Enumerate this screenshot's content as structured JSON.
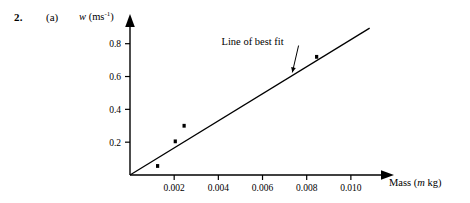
{
  "figure": {
    "question_number": "2.",
    "question_part": "(a)"
  },
  "chart_data": {
    "type": "scatter",
    "title": "",
    "subtitle": "",
    "xlabel": "Mass (m kg)",
    "xlabel_parts": {
      "prefix": "Mass (",
      "variable": "m",
      "suffix": " kg)"
    },
    "ylabel": "w (ms-1)",
    "ylabel_parts": {
      "variable": "w",
      "prefix": " (ms",
      "exponent": "-1",
      "suffix": ")"
    },
    "xlim": [
      0,
      0.0115
    ],
    "ylim": [
      0,
      0.92
    ],
    "xticks": [
      0.002,
      0.004,
      0.006,
      0.008,
      0.01
    ],
    "xticklabels": [
      "0.002",
      "0.004",
      "0.006",
      "0.008",
      "0.010"
    ],
    "yticks": [
      0.2,
      0.4,
      0.6,
      0.8
    ],
    "yticklabels": [
      "0.2",
      "0.4",
      "0.6",
      "0.8"
    ],
    "grid": false,
    "legend_position": "none",
    "axis_arrows": true,
    "points": [
      {
        "x": 0.00125,
        "y": 0.055
      },
      {
        "x": 0.00205,
        "y": 0.205
      },
      {
        "x": 0.00245,
        "y": 0.3
      },
      {
        "x": 0.00845,
        "y": 0.72
      }
    ],
    "series": [
      {
        "name": "Line of best fit",
        "type": "line",
        "x": [
          0.0,
          0.01085
        ],
        "y": [
          0.0,
          0.895
        ]
      }
    ],
    "annotations": [
      {
        "text": "Line of best fit",
        "x": 0.00555,
        "y": 0.795,
        "pointer_to": {
          "x": 0.00735,
          "y": 0.625
        }
      }
    ]
  }
}
